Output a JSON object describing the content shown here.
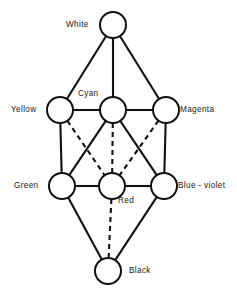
{
  "diagram": {
    "background_color": "#ffffff",
    "stroke_color": "#111111",
    "node_fill_color": "#ffffff",
    "node_radius": 13,
    "nodes": [
      {
        "id": "white",
        "label": "White",
        "cx": 113,
        "cy": 25,
        "label_x": 66,
        "label_y": 20
      },
      {
        "id": "yellow",
        "label": "Yellow",
        "cx": 60,
        "cy": 110,
        "label_x": 11,
        "label_y": 105
      },
      {
        "id": "cyan",
        "label": "Cyan",
        "cx": 113,
        "cy": 110,
        "label_x": 78,
        "label_y": 89
      },
      {
        "id": "magenta",
        "label": "Magenta",
        "cx": 166,
        "cy": 110,
        "label_x": 180,
        "label_y": 105
      },
      {
        "id": "green",
        "label": "Green",
        "cx": 62,
        "cy": 186,
        "label_x": 14,
        "label_y": 181
      },
      {
        "id": "red",
        "label": "Red",
        "cx": 112,
        "cy": 186,
        "label_x": 118,
        "label_y": 196
      },
      {
        "id": "blue-violet",
        "label": "Blue - violet",
        "cx": 164,
        "cy": 186,
        "label_x": 178,
        "label_y": 181
      },
      {
        "id": "black",
        "label": "Black",
        "cx": 108,
        "cy": 271,
        "label_x": 129,
        "label_y": 266
      }
    ],
    "edges": [
      {
        "from": "white",
        "to": "yellow",
        "style": "solid"
      },
      {
        "from": "white",
        "to": "cyan",
        "style": "solid"
      },
      {
        "from": "white",
        "to": "magenta",
        "style": "solid"
      },
      {
        "from": "yellow",
        "to": "cyan",
        "style": "solid"
      },
      {
        "from": "cyan",
        "to": "magenta",
        "style": "solid"
      },
      {
        "from": "yellow",
        "to": "green",
        "style": "solid"
      },
      {
        "from": "magenta",
        "to": "blue-violet",
        "style": "solid"
      },
      {
        "from": "cyan",
        "to": "green",
        "style": "solid"
      },
      {
        "from": "cyan",
        "to": "blue-violet",
        "style": "solid"
      },
      {
        "from": "yellow",
        "to": "red",
        "style": "dashed"
      },
      {
        "from": "magenta",
        "to": "red",
        "style": "dashed"
      },
      {
        "from": "cyan",
        "to": "red",
        "style": "dashed"
      },
      {
        "from": "green",
        "to": "red",
        "style": "solid"
      },
      {
        "from": "red",
        "to": "blue-violet",
        "style": "solid"
      },
      {
        "from": "green",
        "to": "black",
        "style": "solid"
      },
      {
        "from": "blue-violet",
        "to": "black",
        "style": "solid"
      },
      {
        "from": "red",
        "to": "black",
        "style": "dashed"
      }
    ]
  }
}
